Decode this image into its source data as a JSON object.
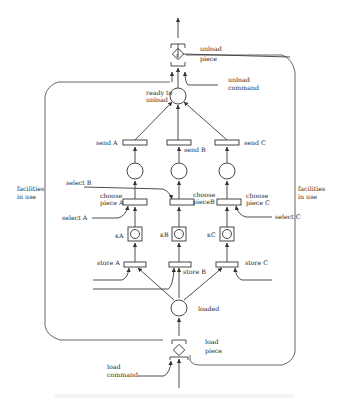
{
  "figure": {
    "type": "petri-net",
    "labels": {
      "unload_piece": [
        "unload",
        "piece"
      ],
      "unload_command": [
        "unload",
        "command"
      ],
      "ready_to_unload": [
        "ready to",
        "unload"
      ],
      "send_a": "send A",
      "send_b": "send B",
      "send_c": "send C",
      "select_a": "select A",
      "select_b": "select B",
      "select_c": "select C",
      "choose_a": [
        "choose",
        "piece A"
      ],
      "choose_b": [
        "choose",
        "pieceB"
      ],
      "choose_c": [
        "choose",
        "piece C"
      ],
      "kappa_a": "κA",
      "kappa_b": "κB",
      "kappa_c": "κC",
      "store_a": "store A",
      "store_b": "store B",
      "store_c": "store C",
      "loaded": "loaded",
      "load_piece": [
        "load",
        "piece"
      ],
      "load_command": [
        "load",
        "command"
      ],
      "facilities_left": [
        "facilities",
        "in use"
      ],
      "facilities_right": [
        "facilities",
        "in use"
      ]
    }
  }
}
